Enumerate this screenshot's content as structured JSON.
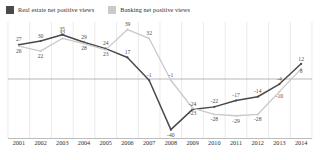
{
  "chart_data": {
    "type": "line",
    "title": "",
    "subtitle": "",
    "xlabel": "",
    "ylabel": "",
    "grid": "vertical",
    "legend_position": "top-left",
    "ylim": [
      -45,
      45
    ],
    "zero_line": 0,
    "categories": [
      "2001",
      "2002",
      "2003",
      "2004",
      "2005",
      "2006",
      "2007",
      "2008",
      "2009",
      "2010",
      "2011",
      "2012",
      "2013",
      "2014"
    ],
    "series": [
      {
        "name": "Real estate net positive views",
        "color": "#4a4a4a",
        "values": [
          27,
          30,
          35,
          29,
          24,
          17,
          -1,
          -40,
          -24,
          -22,
          -17,
          -14,
          -4,
          12
        ]
      },
      {
        "name": "Banking net positive views",
        "color": "#c9c9c9",
        "values": [
          26,
          22,
          32,
          28,
          23,
          39,
          32,
          -1,
          -23,
          -28,
          -29,
          -28,
          -10,
          8
        ]
      }
    ]
  },
  "legend": {
    "items": [
      {
        "label": "Real estate net positive views",
        "color": "#4a4a4a",
        "swatch": "square-marker"
      },
      {
        "label": "Banking net positive views",
        "color": "#c9c9c9",
        "swatch": "square-marker"
      }
    ]
  },
  "colors": {
    "real_estate": "#4a4a4a",
    "banking": "#c9c9c9",
    "gridline": "#dcdcdc",
    "zero_line": "#9a9a9a",
    "axis_rule": "#bdbdbd",
    "background": "#ffffff",
    "label_text": "#4a4a4a"
  }
}
